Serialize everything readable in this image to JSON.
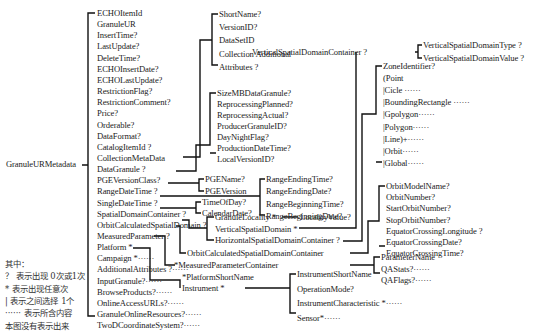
{
  "root": "GranuleURMetadata",
  "level1": [
    "ECHOItemId",
    "GranuleUR",
    "InsertTime?",
    "LastUpdate?",
    "DeleteTime?",
    "ECHOInsertDate?",
    "ECHOLastUpdate?",
    "RestrictionFlag?",
    "RestrictionComment?",
    "Price?",
    "Orderable?",
    "DataFormat?",
    "CatalogItemId ?",
    "CollectionMetaData",
    "DataGranule ?",
    "PGEVersionClass?",
    "RangeDateTime ?",
    "SingleDateTime ?",
    "SpatialDomainContainer ?",
    "OrbitCalculatedSpatialDomain ?",
    "MeasuredParameter ?",
    "Platform *",
    "Campaign *······",
    "AdditionalAttributes ?······",
    "InputGranule?······",
    "BrowseProducts?······",
    "OnlineAccessURLs?······",
    "GranuleOnlineResources?······",
    "TwoDCoordinateSystem?······"
  ],
  "collection": [
    "ShortName?",
    "VersionID?",
    "DataSetID",
    "Collection Additional",
    "Attributes ?"
  ],
  "collection_dot": "·",
  "datagranule": [
    "SizeMBDataGranule?",
    "ReprocessingPlanned?",
    "ReprocessingActual?",
    "ProducerGranuleID?",
    "DayNightFlag?",
    "ProductionDateTime?",
    "LocalVersionID?"
  ],
  "pge": [
    "PGEName?",
    "PGEVersion"
  ],
  "range": [
    "RangeEndingTime?",
    "RangeEndingDate?",
    "RangeBeginningTime?",
    "RangeBeginningDate?"
  ],
  "single": [
    "TimeOfDay?",
    "CalendarDate?"
  ],
  "spatial": [
    "GranuleLocality *",
    "VerticalSpatialDomain *",
    "HorizontalSpatialDomainContainer ?"
  ],
  "locality_value": "LocalityValue?",
  "vertical_container": "VerticalSpatialDomainContainer ?",
  "vertical": [
    "VerticalSpatialDomainType ?",
    "VerticalSpatialDomainValue ?"
  ],
  "horizontal": [
    "ZoneIdentifier?",
    "(Point",
    "|Cicle ······",
    "|BoundingRectangle ······",
    "|Gpolygon······",
    "|Polygon······",
    "|Line)+······",
    "|Orbit······",
    "|Global······"
  ],
  "orbit_container": "OrbitCalculatedSpatialDomainContainer",
  "orbit": [
    "OrbitModelName?",
    "OrbitNumber?",
    "StartOrbitNumber?",
    "StopOrbitNumber?",
    "EquatorCrossingLongitude ?",
    "EquatorCrossingDate?",
    "EquatorCrossingTime?"
  ],
  "measured_container": "*MeasuredParameterContainer",
  "measured": [
    "ParameterName",
    "QAStats?······",
    "QAFlags?······"
  ],
  "platform": [
    "*PlatformShortName",
    "Instrument *"
  ],
  "instrument": [
    "InstrumentShortName",
    "OperationMode?",
    "InstrumentCharacteristic *······",
    "Sensor*······"
  ],
  "legend": [
    "其中：",
    "？ 表示出现 0次或1次",
    "* 表示出现任意次",
    "| 表示之间选择 1个",
    "······ 表示所含内容",
    "本图没有表示出来"
  ]
}
